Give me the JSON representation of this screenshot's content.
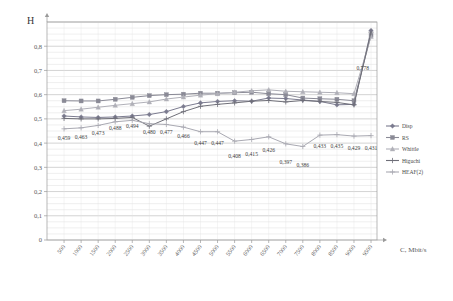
{
  "chart_data": {
    "type": "line",
    "title": "",
    "ylabel": "H",
    "xlabel": "C, Mbit/s",
    "grid": true,
    "legend_position": "right",
    "ylim": [
      0,
      0.9
    ],
    "y_ticks": [
      "0",
      "0,1",
      "0,2",
      "0,3",
      "0,4",
      "0,5",
      "0,6",
      "0,7",
      "0,8"
    ],
    "y_tick_values": [
      0,
      0.1,
      0.2,
      0.3,
      0.4,
      0.5,
      0.6,
      0.7,
      0.8
    ],
    "categories": [
      "500",
      "1000",
      "1500",
      "2000",
      "2500",
      "3000",
      "3500",
      "4000",
      "4500",
      "5000",
      "5500",
      "6000",
      "6500",
      "7000",
      "7500",
      "8000",
      "8500",
      "9000",
      "9500"
    ],
    "x_tick_labels": [
      "500",
      "1000",
      "1500",
      "2000",
      "2500",
      "3000",
      "3500",
      "4000",
      "4500",
      "5000",
      "5500",
      "6000",
      "6500",
      "7000",
      "7500",
      "8000",
      "8500",
      "9000",
      "9500"
    ],
    "series": [
      {
        "name": "Disp",
        "color": "#7b7b8f",
        "marker": "diamond",
        "values": [
          0.512,
          0.508,
          0.506,
          0.508,
          0.512,
          0.518,
          0.53,
          0.551,
          0.566,
          0.572,
          0.575,
          0.573,
          0.586,
          0.584,
          0.578,
          0.572,
          0.558,
          0.56,
          0.865
        ]
      },
      {
        "name": "RS",
        "color": "#8a8a96",
        "marker": "square",
        "values": [
          0.575,
          0.574,
          0.574,
          0.581,
          0.589,
          0.596,
          0.6,
          0.602,
          0.606,
          0.606,
          0.608,
          0.61,
          0.604,
          0.6,
          0.586,
          0.583,
          0.581,
          0.575,
          0.845
        ]
      },
      {
        "name": "Whittle",
        "color": "#b0b0b8",
        "marker": "triangle",
        "values": [
          0.534,
          0.54,
          0.548,
          0.556,
          0.563,
          0.57,
          0.582,
          0.59,
          0.598,
          0.604,
          0.61,
          0.616,
          0.62,
          0.614,
          0.612,
          0.61,
          0.608,
          0.604,
          0.84
        ]
      },
      {
        "name": "Higuchi",
        "color": "#6f6f78",
        "marker": "cross",
        "values": [
          0.502,
          0.5,
          0.5,
          0.502,
          0.506,
          0.47,
          0.5,
          0.53,
          0.552,
          0.56,
          0.566,
          0.573,
          0.576,
          0.57,
          0.576,
          0.572,
          0.568,
          0.558,
          0.858
        ]
      },
      {
        "name": "HEAF(2)",
        "color": "#a9a9b2",
        "marker": "cross",
        "values": [
          0.459,
          0.463,
          0.473,
          0.488,
          0.494,
          0.48,
          0.477,
          0.466,
          0.447,
          0.447,
          0.408,
          0.415,
          0.426,
          0.397,
          0.386,
          0.433,
          0.435,
          0.429,
          0.431
        ]
      }
    ],
    "data_labels": [
      {
        "text": "0,459",
        "series": "HEAF(2)",
        "index": 0
      },
      {
        "text": "0,463",
        "series": "HEAF(2)",
        "index": 1
      },
      {
        "text": "0,473",
        "series": "HEAF(2)",
        "index": 2
      },
      {
        "text": "0,488",
        "series": "HEAF(2)",
        "index": 3
      },
      {
        "text": "0,494",
        "series": "HEAF(2)",
        "index": 4
      },
      {
        "text": "0,480",
        "series": "HEAF(2)",
        "index": 5
      },
      {
        "text": "0,477",
        "series": "HEAF(2)",
        "index": 6
      },
      {
        "text": "0,466",
        "series": "HEAF(2)",
        "index": 7
      },
      {
        "text": "0,447",
        "series": "HEAF(2)",
        "index": 8
      },
      {
        "text": "0,447",
        "series": "HEAF(2)",
        "index": 9
      },
      {
        "text": "0,408",
        "series": "HEAF(2)",
        "index": 10
      },
      {
        "text": "0,415",
        "series": "HEAF(2)",
        "index": 11
      },
      {
        "text": "0,426",
        "series": "HEAF(2)",
        "index": 12
      },
      {
        "text": "0,397",
        "series": "HEAF(2)",
        "index": 13
      },
      {
        "text": "0,386",
        "series": "HEAF(2)",
        "index": 14
      },
      {
        "text": "0,433",
        "series": "HEAF(2)",
        "index": 15
      },
      {
        "text": "0,435",
        "series": "HEAF(2)",
        "index": 16
      },
      {
        "text": "0,429",
        "series": "HEAF(2)",
        "index": 17
      },
      {
        "text": "0,431",
        "series": "HEAF(2)",
        "index": 18
      },
      {
        "text": "0,778",
        "series": "Disp",
        "index": 18
      }
    ]
  }
}
